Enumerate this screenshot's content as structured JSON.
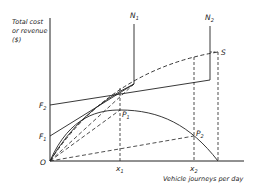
{
  "diagram": {
    "y_axis_label_lines": [
      "Total cost",
      "or revenue",
      "($)"
    ],
    "x_axis_label": "Vehicle journeys per day",
    "origin_label": "O",
    "points": {
      "F1": {
        "main": "F",
        "sub": "1"
      },
      "F2": {
        "main": "F",
        "sub": "2"
      },
      "N1": {
        "main": "N",
        "sub": "1"
      },
      "N2": {
        "main": "N",
        "sub": "2"
      },
      "S": {
        "main": "S",
        "sub": ""
      },
      "P1": {
        "main": "P",
        "sub": "1"
      },
      "P2": {
        "main": "P",
        "sub": "2"
      },
      "x1": {
        "main": "x",
        "sub": "1"
      },
      "x2": {
        "main": "x",
        "sub": "2"
      }
    },
    "colors": {
      "ink": "#222222",
      "background": "#ffffff"
    }
  }
}
